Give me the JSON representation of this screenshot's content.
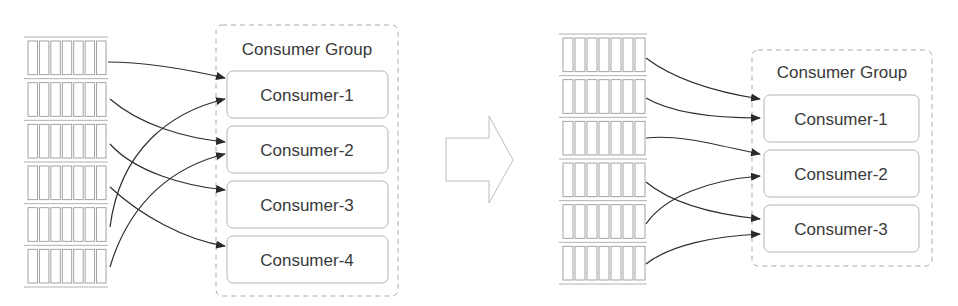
{
  "diagram": {
    "before": {
      "group_title": "Consumer Group",
      "partitions": 6,
      "consumers": [
        "Consumer-1",
        "Consumer-2",
        "Consumer-3",
        "Consumer-4"
      ],
      "assignments": [
        {
          "partition": 1,
          "consumer": "Consumer-1"
        },
        {
          "partition": 2,
          "consumer": "Consumer-2"
        },
        {
          "partition": 3,
          "consumer": "Consumer-3"
        },
        {
          "partition": 4,
          "consumer": "Consumer-4"
        },
        {
          "partition": 5,
          "consumer": "Consumer-1"
        },
        {
          "partition": 6,
          "consumer": "Consumer-2"
        }
      ]
    },
    "transition_icon": "right-arrow-icon",
    "after": {
      "group_title": "Consumer Group",
      "partitions": 6,
      "consumers": [
        "Consumer-1",
        "Consumer-2",
        "Consumer-3"
      ],
      "assignments": [
        {
          "partition": 1,
          "consumer": "Consumer-1"
        },
        {
          "partition": 2,
          "consumer": "Consumer-1"
        },
        {
          "partition": 3,
          "consumer": "Consumer-2"
        },
        {
          "partition": 4,
          "consumer": "Consumer-3"
        },
        {
          "partition": 5,
          "consumer": "Consumer-2"
        },
        {
          "partition": 6,
          "consumer": "Consumer-3"
        }
      ]
    },
    "colors": {
      "line": "#333333",
      "partition_stroke": "#9a9a9a",
      "box_stroke": "#b5b5b5",
      "text": "#3a3a3a"
    }
  }
}
